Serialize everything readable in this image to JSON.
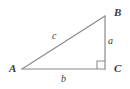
{
  "figure": {
    "type": "right-triangle-diagram",
    "background_color": "#ffffff",
    "stroke_color": "#8a8a8a",
    "label_color": "#3a3a3a",
    "vertices": [
      {
        "name": "A",
        "label": "A",
        "x": 22,
        "y": 69,
        "angle": "acute"
      },
      {
        "name": "B",
        "label": "B",
        "x": 105,
        "y": 16,
        "angle": "acute"
      },
      {
        "name": "C",
        "label": "C",
        "x": 105,
        "y": 69,
        "angle": "right"
      }
    ],
    "sides": [
      {
        "name": "a",
        "label": "a",
        "from": "B",
        "to": "C",
        "role": "opposite-A-vertical-leg"
      },
      {
        "name": "b",
        "label": "b",
        "from": "A",
        "to": "C",
        "role": "opposite-B-horizontal-leg"
      },
      {
        "name": "c",
        "label": "c",
        "from": "A",
        "to": "B",
        "role": "hypotenuse"
      }
    ],
    "right_angle_marker": {
      "at_vertex": "C",
      "size": 8,
      "shape": "square"
    }
  }
}
